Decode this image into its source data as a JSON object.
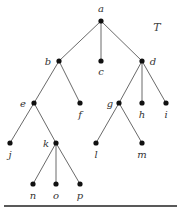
{
  "diagram": {
    "title": "T",
    "type": "rooted tree",
    "nodes": [
      {
        "id": "a",
        "label": "a",
        "x": 101,
        "y": 21,
        "lx": 101,
        "ly": 12
      },
      {
        "id": "b",
        "label": "b",
        "x": 59,
        "y": 61,
        "lx": 48,
        "ly": 65
      },
      {
        "id": "c",
        "label": "c",
        "x": 101,
        "y": 61,
        "lx": 101,
        "ly": 75
      },
      {
        "id": "d",
        "label": "d",
        "x": 142,
        "y": 61,
        "lx": 153,
        "ly": 65
      },
      {
        "id": "e",
        "label": "e",
        "x": 34,
        "y": 103,
        "lx": 23,
        "ly": 107
      },
      {
        "id": "f",
        "label": "f",
        "x": 80,
        "y": 103,
        "lx": 80,
        "ly": 118
      },
      {
        "id": "g",
        "label": "g",
        "x": 119,
        "y": 103,
        "lx": 110,
        "ly": 107
      },
      {
        "id": "h",
        "label": "h",
        "x": 142,
        "y": 103,
        "lx": 142,
        "ly": 118
      },
      {
        "id": "i",
        "label": "i",
        "x": 166,
        "y": 103,
        "lx": 166,
        "ly": 118
      },
      {
        "id": "j",
        "label": "j",
        "x": 10,
        "y": 143,
        "lx": 10,
        "ly": 158
      },
      {
        "id": "k",
        "label": "k",
        "x": 56,
        "y": 143,
        "lx": 46,
        "ly": 147
      },
      {
        "id": "l",
        "label": "l",
        "x": 96,
        "y": 143,
        "lx": 96,
        "ly": 158
      },
      {
        "id": "m",
        "label": "m",
        "x": 142,
        "y": 143,
        "lx": 142,
        "ly": 158
      },
      {
        "id": "n",
        "label": "n",
        "x": 33,
        "y": 184,
        "lx": 33,
        "ly": 199
      },
      {
        "id": "o",
        "label": "o",
        "x": 56,
        "y": 184,
        "lx": 56,
        "ly": 199
      },
      {
        "id": "p",
        "label": "p",
        "x": 80,
        "y": 184,
        "lx": 80,
        "ly": 199
      }
    ],
    "edges": [
      [
        "a",
        "b"
      ],
      [
        "a",
        "c"
      ],
      [
        "a",
        "d"
      ],
      [
        "b",
        "e"
      ],
      [
        "b",
        "f"
      ],
      [
        "d",
        "g"
      ],
      [
        "d",
        "h"
      ],
      [
        "d",
        "i"
      ],
      [
        "e",
        "j"
      ],
      [
        "e",
        "k"
      ],
      [
        "g",
        "l"
      ],
      [
        "g",
        "m"
      ],
      [
        "k",
        "n"
      ],
      [
        "k",
        "o"
      ],
      [
        "k",
        "p"
      ]
    ],
    "title_pos": {
      "x": 157,
      "y": 31
    }
  }
}
